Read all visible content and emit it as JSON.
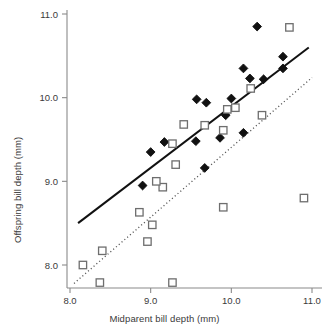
{
  "chart_data": {
    "type": "scatter",
    "title": "",
    "xlabel": "Midparent bill depth (mm)",
    "ylabel": "Offspring bill depth (mm)",
    "xlim": [
      7.85,
      11.1
    ],
    "ylim": [
      7.62,
      11.12
    ],
    "xticks": [
      8.0,
      9.0,
      10.0,
      11.0
    ],
    "xticklabels": [
      "8.0",
      "9.0",
      "10.0",
      "11.0"
    ],
    "yticks": [
      8.0,
      9.0,
      10.0,
      11.0
    ],
    "yticklabels": [
      "8.0",
      "9.0",
      "10.0",
      "11.0"
    ],
    "grid": false,
    "legend": "none",
    "series": [
      {
        "name": "filled-diamonds",
        "marker": "diamond",
        "marker_fill": "#111111",
        "marker_edge": "#111111",
        "points": [
          [
            10.32,
            10.85
          ],
          [
            10.64,
            10.49
          ],
          [
            10.64,
            10.35
          ],
          [
            10.4,
            10.22
          ],
          [
            10.23,
            10.23
          ],
          [
            10.15,
            10.35
          ],
          [
            10.0,
            9.99
          ],
          [
            9.93,
            9.79
          ],
          [
            9.86,
            9.52
          ],
          [
            10.15,
            9.58
          ],
          [
            9.69,
            9.94
          ],
          [
            9.57,
            9.98
          ],
          [
            9.56,
            9.48
          ],
          [
            9.17,
            9.47
          ],
          [
            9.0,
            9.35
          ],
          [
            8.9,
            8.95
          ],
          [
            9.67,
            9.16
          ]
        ]
      },
      {
        "name": "open-squares",
        "marker": "square",
        "marker_fill": "#ffffff",
        "marker_edge": "#6e6e6e",
        "points": [
          [
            10.72,
            10.84
          ],
          [
            10.24,
            10.11
          ],
          [
            10.05,
            9.88
          ],
          [
            9.95,
            9.86
          ],
          [
            9.9,
            9.61
          ],
          [
            10.38,
            9.79
          ],
          [
            10.9,
            8.8
          ],
          [
            9.9,
            8.69
          ],
          [
            9.67,
            9.67
          ],
          [
            9.41,
            9.68
          ],
          [
            9.31,
            9.2
          ],
          [
            9.27,
            9.45
          ],
          [
            9.15,
            8.93
          ],
          [
            9.07,
            9.0
          ],
          [
            8.86,
            8.63
          ],
          [
            9.02,
            8.48
          ],
          [
            8.96,
            8.28
          ],
          [
            8.4,
            8.17
          ],
          [
            8.16,
            8.0
          ],
          [
            8.37,
            7.79
          ],
          [
            9.27,
            7.79
          ]
        ]
      }
    ],
    "lines": [
      {
        "name": "solid-regression-line",
        "style": "solid",
        "color": "#111111",
        "x": [
          8.1,
          10.96
        ],
        "y": [
          8.5,
          10.6
        ]
      },
      {
        "name": "dotted-regression-line",
        "style": "dotted",
        "color": "#555555",
        "x": [
          8.05,
          11.0
        ],
        "y": [
          7.78,
          10.24
        ]
      }
    ]
  }
}
